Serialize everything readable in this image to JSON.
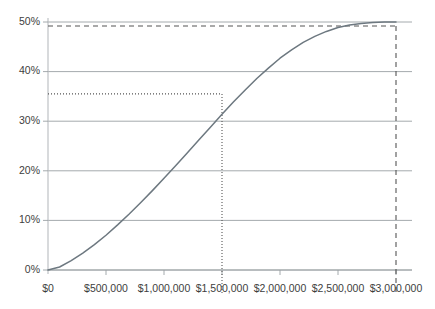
{
  "chart_data": {
    "type": "line",
    "title": "",
    "xlabel": "",
    "ylabel": "",
    "xlim": [
      0,
      3000000
    ],
    "ylim": [
      0,
      50
    ],
    "grid": true,
    "legend": "none",
    "x_tick_labels": [
      "$0",
      "$500,000",
      "$1,000,000",
      "$1,500,000",
      "$2,000,000",
      "$2,500,000",
      "$3,000,000"
    ],
    "x_tick_values": [
      0,
      500000,
      1000000,
      1500000,
      2000000,
      2500000,
      3000000
    ],
    "y_tick_labels": [
      "0%",
      "10%",
      "20%",
      "30%",
      "40%",
      "50%"
    ],
    "y_tick_values": [
      0,
      10,
      20,
      30,
      40,
      50
    ],
    "series": [
      {
        "name": "curve",
        "color": "#6d7880",
        "x": [
          0,
          100000,
          200000,
          300000,
          400000,
          500000,
          600000,
          700000,
          800000,
          900000,
          1000000,
          1100000,
          1200000,
          1300000,
          1400000,
          1500000,
          1600000,
          1700000,
          1800000,
          1900000,
          2000000,
          2100000,
          2200000,
          2300000,
          2400000,
          2500000,
          2600000,
          2700000,
          2800000,
          2900000,
          3000000
        ],
        "y": [
          0.0,
          0.6,
          1.9,
          3.4,
          5.1,
          7.0,
          9.1,
          11.3,
          13.6,
          16.0,
          18.5,
          21.0,
          23.6,
          26.2,
          28.8,
          31.4,
          33.9,
          36.3,
          38.6,
          40.7,
          42.7,
          44.4,
          45.9,
          47.1,
          48.1,
          48.9,
          49.4,
          49.7,
          49.9,
          50.0,
          50.0
        ]
      }
    ],
    "annotations": [
      {
        "name": "dotted-guide",
        "style": "dotted",
        "color": "#555555",
        "x": 1500000,
        "y": 35.5,
        "label": ""
      },
      {
        "name": "dashed-guide",
        "style": "dashed",
        "color": "#555555",
        "x": 3000000,
        "y": 49.2,
        "label": ""
      }
    ],
    "axis_color": "#b8bcbf",
    "grid_color": "#9aa0a4",
    "background": "#ffffff"
  }
}
